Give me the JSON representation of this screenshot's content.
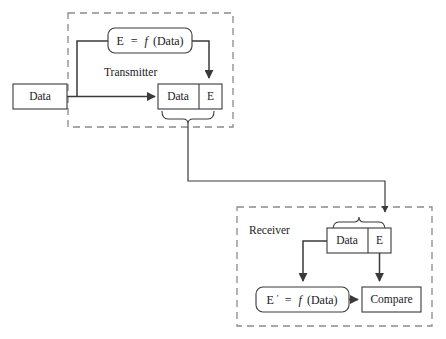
{
  "diagram": {
    "regions": [
      {
        "id": "transmitter",
        "label": "Transmitter"
      },
      {
        "id": "receiver",
        "label": "Receiver"
      }
    ],
    "nodes": {
      "source_data": {
        "label": "Data"
      },
      "tx_formula": {
        "lhs": "E",
        "eq": "=",
        "fn": "f",
        "arg": "(Data)",
        "full_label": "E = f (Data)"
      },
      "tx_packet": {
        "data_cell": "Data",
        "code_cell": "E"
      },
      "rx_packet": {
        "data_cell": "Data",
        "code_cell": "E"
      },
      "rx_formula": {
        "lhs": "E",
        "prime": "′",
        "eq": "=",
        "fn": "f",
        "arg": "(Data)",
        "full_label": "E′ = f (Data)"
      },
      "compare": {
        "label": "Compare"
      }
    },
    "colors": {
      "line": "#3a3a3a",
      "dashed_region": "#8a8a8a",
      "text": "#1a1a1a",
      "background": "#ffffff"
    },
    "edges": [
      {
        "from": "source_data",
        "to": "tx_packet",
        "style": "solid-arrow"
      },
      {
        "from": "source_data",
        "to": "tx_formula",
        "style": "solid-branch"
      },
      {
        "from": "tx_formula",
        "to": "tx_packet.code_cell",
        "style": "solid-arrow"
      },
      {
        "from": "tx_packet",
        "to": "rx_packet",
        "style": "channel-arrow"
      },
      {
        "from": "rx_packet.data_cell",
        "to": "rx_formula",
        "style": "solid-arrow"
      },
      {
        "from": "rx_packet.code_cell",
        "to": "compare",
        "style": "solid-arrow"
      },
      {
        "from": "rx_formula",
        "to": "compare",
        "style": "solid-arrow"
      }
    ]
  }
}
